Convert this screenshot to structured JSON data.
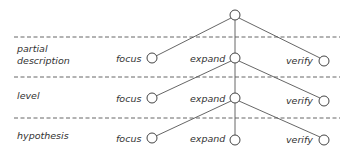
{
  "diagram": {
    "type": "search-tree",
    "root": {
      "x": 235,
      "y": 15
    },
    "separators": [
      {
        "y": 37
      },
      {
        "y": 77
      },
      {
        "y": 118
      }
    ],
    "levels": [
      {
        "name_lines": [
          "partial",
          "description"
        ],
        "nodes": {
          "focus": {
            "label": "focus",
            "x": 152,
            "y": 58
          },
          "expand": {
            "label": "expand",
            "x": 235,
            "y": 58
          },
          "verify": {
            "label": "verify",
            "x": 324,
            "y": 61
          }
        }
      },
      {
        "name_lines": [
          "level"
        ],
        "nodes": {
          "focus": {
            "label": "focus",
            "x": 152,
            "y": 98
          },
          "expand": {
            "label": "expand",
            "x": 235,
            "y": 98
          },
          "verify": {
            "label": "verify",
            "x": 324,
            "y": 101
          }
        }
      },
      {
        "name_lines": [
          "hypothesis"
        ],
        "nodes": {
          "focus": {
            "label": "focus",
            "x": 152,
            "y": 138
          },
          "expand": {
            "label": "expand",
            "x": 235,
            "y": 140
          },
          "verify": {
            "label": "verify",
            "x": 324,
            "y": 140
          }
        }
      }
    ]
  }
}
